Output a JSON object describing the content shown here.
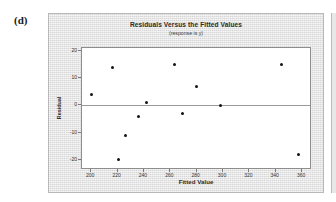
{
  "panel": {
    "label": "(d)"
  },
  "chart_data": {
    "type": "scatter",
    "title": "Residuals Versus the Fitted Values",
    "subtitle": "(response is y)",
    "xlabel": "Fitted Value",
    "ylabel": "Residual",
    "xlim": [
      193,
      366
    ],
    "ylim": [
      -23,
      21
    ],
    "xticks": [
      200,
      220,
      240,
      260,
      280,
      300,
      320,
      340,
      360
    ],
    "yticks": [
      20,
      10,
      0,
      -10,
      -20
    ],
    "grid": false,
    "legend": null,
    "reference_line": {
      "axis": "y",
      "value": 0
    },
    "points": [
      {
        "x": 200,
        "y": 4
      },
      {
        "x": 216,
        "y": 14
      },
      {
        "x": 221,
        "y": -20
      },
      {
        "x": 226,
        "y": -11
      },
      {
        "x": 236,
        "y": -4
      },
      {
        "x": 242,
        "y": 1
      },
      {
        "x": 263,
        "y": 15
      },
      {
        "x": 269,
        "y": -3
      },
      {
        "x": 280,
        "y": 7
      },
      {
        "x": 298,
        "y": 0
      },
      {
        "x": 344,
        "y": 15
      },
      {
        "x": 357,
        "y": -18
      }
    ]
  }
}
